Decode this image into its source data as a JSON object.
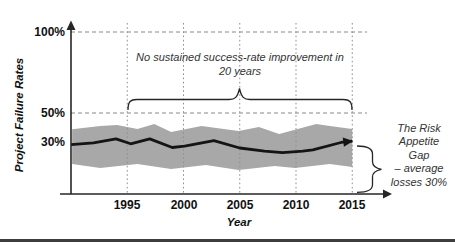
{
  "figure": {
    "y_axis_title": "Project Failure Rates",
    "x_axis_title": "Year",
    "y_ticks": [
      "100%",
      "50%",
      "30%"
    ],
    "x_ticks": [
      "1995",
      "2000",
      "2005",
      "2010",
      "2015"
    ],
    "annotations": {
      "no_improvement_line1": "No sustained success-rate improvement in",
      "no_improvement_line2": "20 years",
      "risk_gap_line1": "The Risk",
      "risk_gap_line2": "Appetite",
      "risk_gap_line3": "Gap",
      "risk_gap_line4": "– average",
      "risk_gap_line5": "losses 30%"
    }
  },
  "colors": {
    "band": "#a8a8a8",
    "line": "#141414",
    "axis": "#262626",
    "dashed": "#8a8a8a",
    "grid": "#8f8f8f"
  },
  "chart_data": {
    "type": "line",
    "title": "",
    "xlabel": "Year",
    "ylabel": "Project Failure Rates (%)",
    "x_tick_years": [
      1995,
      2000,
      2005,
      2010,
      2015
    ],
    "y_tick_percents": [
      100,
      50,
      30
    ],
    "xlim": [
      1990,
      2016.5
    ],
    "ylim": [
      0,
      106
    ],
    "grid": "dotted vertical gridlines at 5-year intervals; dashed horizontal reference lines at 50% and 100%",
    "legend": "none",
    "series": [
      {
        "name": "Average project failure rate",
        "style": "thick black line ending in right-pointing arrow",
        "x": [
          1990,
          1992,
          1994,
          1995.3,
          1997,
          1999,
          2000.1,
          2002.7,
          2005,
          2007.2,
          2008.8,
          2010.6,
          2011.5,
          2014,
          2015
        ],
        "y": [
          30.5,
          31.5,
          34,
          31,
          34,
          28.7,
          29.6,
          33,
          28.4,
          26.5,
          25.6,
          26.5,
          27.2,
          31.8,
          32.7
        ]
      },
      {
        "name": "Failure-rate range (upper bound)",
        "style": "gray band upper edge",
        "x": [
          1990.1,
          1992.6,
          1994.1,
          1995.9,
          1997.4,
          1998.9,
          2001.6,
          2004.9,
          2006.7,
          2008.5,
          2011.8,
          2013,
          2015
        ],
        "y": [
          40,
          42,
          42.6,
          40.1,
          43.2,
          38.3,
          42,
          38.9,
          41.4,
          37,
          43.2,
          42,
          40.1
        ]
      },
      {
        "name": "Failure-rate range (lower bound)",
        "style": "gray band lower edge",
        "x": [
          1990.1,
          1992.6,
          1995.9,
          1998.9,
          2002,
          2004.9,
          2008.1,
          2009.9,
          2013,
          2015
        ],
        "y": [
          18.5,
          16,
          18.5,
          15.4,
          17.9,
          14.8,
          17.3,
          16,
          18.5,
          16.7
        ]
      }
    ],
    "annotations": [
      {
        "text": "No sustained success-rate improvement in 20 years",
        "marker": "horizontal curly brace spanning 1995–2015 just above the 50% line",
        "span_years": [
          1995,
          2015
        ]
      },
      {
        "text": "The Risk Appetite Gap – average losses 30%",
        "marker": "vertical curly brace at right edge spanning from the trend line (~30%) down to the x-axis (0%)",
        "span_percent": [
          0,
          30
        ]
      }
    ]
  }
}
